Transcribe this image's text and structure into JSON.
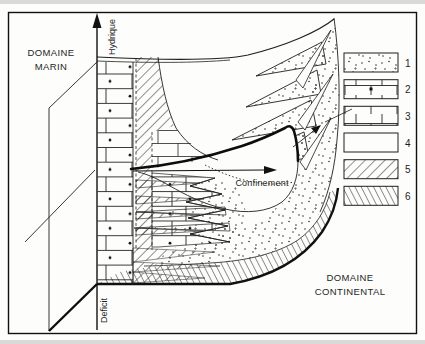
{
  "figure": {
    "type": "geological-schematic",
    "ink_color": "#1f1f1f",
    "paper_color": "#fdfdfb"
  },
  "labels": {
    "marine_domain_line1": "DOMAINE",
    "marine_domain_line2": "MARIN",
    "continental_domain_line1": "DOMAINE",
    "continental_domain_line2": "CONTINENTAL",
    "axis_top": "Hydrique",
    "axis_bottom": "Deficit",
    "confinement": "Confinement"
  },
  "legend": {
    "items": [
      {
        "number": "1",
        "pattern": "stipple-dots"
      },
      {
        "number": "2",
        "pattern": "brick-with-dot"
      },
      {
        "number": "3",
        "pattern": "brick"
      },
      {
        "number": "4",
        "pattern": "blank"
      },
      {
        "number": "5",
        "pattern": "diagonal-hatch"
      },
      {
        "number": "6",
        "pattern": "steep-hatch"
      }
    ]
  }
}
